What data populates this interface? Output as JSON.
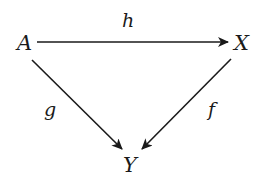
{
  "diagram": {
    "type": "commutative-triangle",
    "nodes": {
      "A": {
        "label": "A"
      },
      "X": {
        "label": "X"
      },
      "Y": {
        "label": "Y"
      }
    },
    "edges": {
      "h": {
        "label": "h",
        "from": "A",
        "to": "X"
      },
      "g": {
        "label": "g",
        "from": "A",
        "to": "Y"
      },
      "f": {
        "label": "f",
        "from": "X",
        "to": "Y"
      }
    },
    "colors": {
      "stroke": "#1a1a1a",
      "background": "#ffffff"
    }
  }
}
